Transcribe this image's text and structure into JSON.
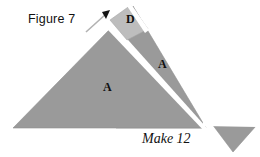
{
  "figure": {
    "caption": "Figure 7",
    "instruction": "Make 12",
    "pieces": [
      {
        "label": "A",
        "name": "large-left-triangle",
        "shade": "#9a9a9a"
      },
      {
        "label": "A",
        "name": "right-strip-triangle",
        "shade": "#9a9a9a"
      },
      {
        "label": "D",
        "name": "apex-diamond",
        "shade": "#bdbdbd"
      }
    ],
    "colors": {
      "background": "#ffffff",
      "piece_fill": "#9a9a9a",
      "piece_fill_light": "#bdbdbd",
      "piece_outline": "#8a8a8a",
      "cut_line": "#ffffff",
      "arrow": "#b0b0b0",
      "text": "#111111"
    },
    "annotations": {
      "arrow_name": "pointer-arrow",
      "arrow_target": "D"
    }
  }
}
